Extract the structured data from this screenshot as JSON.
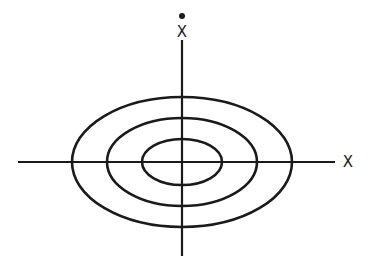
{
  "diagram": {
    "center": {
      "x": 182,
      "y": 162
    },
    "stroke_color": "#1a1a1a",
    "axes": {
      "horizontal": {
        "label": "X",
        "x1": 18,
        "x2": 335,
        "y": 162,
        "label_x": 348,
        "label_y": 162
      },
      "vertical": {
        "label": "X",
        "has_dot": true,
        "x": 182,
        "y1": 40,
        "y2": 256,
        "label_x": 182,
        "label_y": 32,
        "dot_y": 16
      }
    },
    "ellipses": [
      {
        "name": "inner",
        "rx": 40,
        "ry": 23
      },
      {
        "name": "middle",
        "rx": 75,
        "ry": 44
      },
      {
        "name": "outer",
        "rx": 110,
        "ry": 65
      }
    ]
  }
}
